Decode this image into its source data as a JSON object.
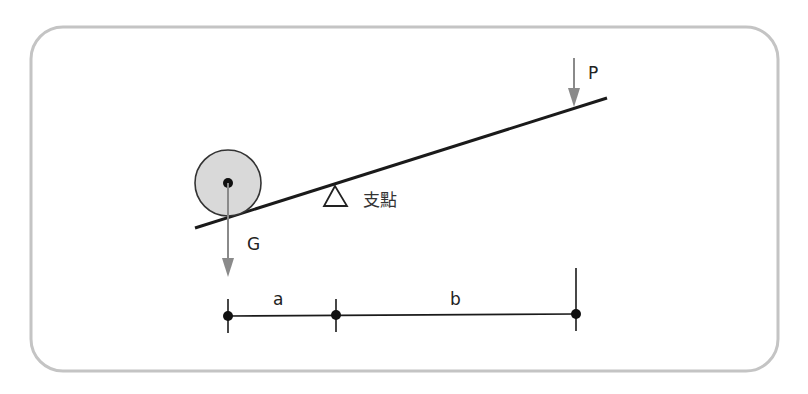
{
  "diagram": {
    "labels": {
      "effort": "P",
      "load": "G",
      "fulcrum": "支點",
      "load_arm": "a",
      "effort_arm": "b"
    },
    "colors": {
      "frame": "#bdbdbd",
      "lever": "#1a1a1a",
      "arrow": "#8a8a8a",
      "ball_fill": "#d9d9d9",
      "ball_stroke": "#333333",
      "dimension": "#1a1a1a"
    }
  }
}
